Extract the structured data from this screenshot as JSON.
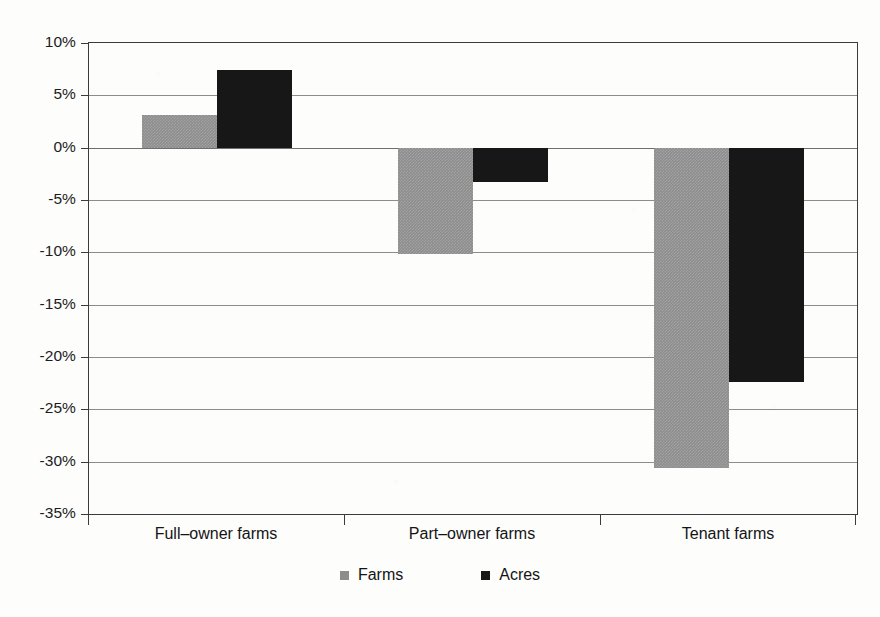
{
  "chart_data": {
    "type": "bar",
    "title": "",
    "subtitle": "",
    "xlabel": "",
    "ylabel": "",
    "categories": [
      "Full–owner farms",
      "Part–owner farms",
      "Tenant farms"
    ],
    "series": [
      {
        "name": "Farms",
        "color": "#8d8d8d",
        "values": [
          3.1,
          -10.2,
          -30.6
        ]
      },
      {
        "name": "Acres",
        "color": "#171717",
        "values": [
          7.4,
          -3.3,
          -22.4
        ]
      }
    ],
    "ylim": [
      -35,
      10
    ],
    "ytick_values": [
      10,
      5,
      0,
      -5,
      -10,
      -15,
      -20,
      -25,
      -30,
      -35
    ],
    "ytick_labels": [
      "10%",
      "5%",
      "0%",
      "-5%",
      "-10%",
      "-15%",
      "-20%",
      "-25%",
      "-30%",
      "-35%"
    ],
    "value_format": "percent",
    "grid": {
      "horizontal": true,
      "vertical": false,
      "color": "#8c8c8c"
    },
    "legend": {
      "position": "bottom",
      "entries": [
        "Farms",
        "Acres"
      ]
    },
    "frame_color": "#3b3b3b",
    "background_color": "#fdfdfc",
    "annotations": []
  }
}
